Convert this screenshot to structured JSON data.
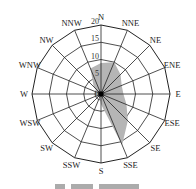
{
  "chart_data": {
    "type": "radar",
    "subtype": "wind-rose",
    "title": "",
    "directions": [
      "N",
      "NNE",
      "NE",
      "ENE",
      "E",
      "ESE",
      "SE",
      "SSE",
      "S",
      "SSW",
      "SW",
      "WSW",
      "W",
      "WNW",
      "NW",
      "NNW"
    ],
    "values": [
      9,
      10,
      8,
      6.5,
      6.5,
      8,
      11,
      16,
      3,
      1,
      0.5,
      0.5,
      0.5,
      1,
      3,
      8
    ],
    "radial_ticks": [
      0,
      5,
      10,
      15,
      20
    ],
    "rlim": [
      0,
      20
    ],
    "grid": "16-sided polygonal rings with radial spokes",
    "fill_color": "#b5b5b5",
    "center_marker_color": "#000000"
  }
}
